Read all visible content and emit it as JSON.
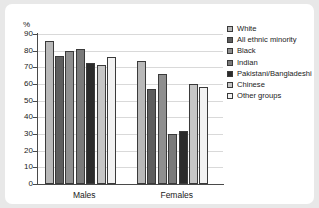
{
  "chart_data": {
    "type": "bar",
    "title": "",
    "xlabel": "",
    "ylabel": "%",
    "ylim": [
      0,
      90
    ],
    "ytick_step": 10,
    "yticks": [
      "0",
      "10",
      "20",
      "30",
      "40",
      "50",
      "60",
      "70",
      "80",
      "90"
    ],
    "grid": true,
    "legend_position": "right",
    "categories": [
      "Males",
      "Females"
    ],
    "series": [
      {
        "name": "White",
        "color": "#b9b9b9",
        "values": [
          86,
          74
        ]
      },
      {
        "name": "All ethnic minority",
        "color": "#5e5e5e",
        "values": [
          77,
          57
        ]
      },
      {
        "name": "Black",
        "color": "#8f8f8f",
        "values": [
          80,
          66
        ]
      },
      {
        "name": "Indian",
        "color": "#7a7a7a",
        "values": [
          81,
          30
        ]
      },
      {
        "name": "Pakistani/Bangladeshi",
        "color": "#2b2b2b",
        "values": [
          72.5,
          32
        ]
      },
      {
        "name": "Chinese",
        "color": "#c6c6c6",
        "values": [
          71.5,
          60
        ]
      },
      {
        "name": "Other groups",
        "color": "#f2f2f2",
        "values": [
          76.5,
          58.5
        ]
      }
    ]
  }
}
